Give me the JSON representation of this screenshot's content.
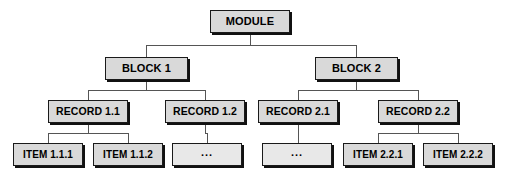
{
  "diagram": {
    "type": "hierarchy-tree",
    "levels": [
      "MODULE",
      "BLOCK",
      "RECORD",
      "ITEM"
    ],
    "style": {
      "node_fill": "#d9d9d9",
      "ellipsis_fill": "#e8e8e8",
      "node_border": "#1a1a1a",
      "node_shadow": "#111111",
      "connector_color": "#555555",
      "background": "#ffffff"
    },
    "nodes": [
      {
        "id": "module",
        "label": "MODULE",
        "level": "module",
        "x": 210,
        "y": 10,
        "w": 80,
        "h": 23
      },
      {
        "id": "block1",
        "label": "BLOCK 1",
        "level": "block",
        "x": 105,
        "y": 57,
        "w": 83,
        "h": 23
      },
      {
        "id": "block2",
        "label": "BLOCK 2",
        "level": "block",
        "x": 315,
        "y": 57,
        "w": 83,
        "h": 23
      },
      {
        "id": "record11",
        "label": "RECORD 1.1",
        "level": "record",
        "x": 48,
        "y": 100,
        "w": 80,
        "h": 23
      },
      {
        "id": "record12",
        "label": "RECORD 1.2",
        "level": "record",
        "x": 165,
        "y": 100,
        "w": 80,
        "h": 23
      },
      {
        "id": "record21",
        "label": "RECORD 2.1",
        "level": "record",
        "x": 258,
        "y": 100,
        "w": 80,
        "h": 23
      },
      {
        "id": "record22",
        "label": "RECORD 2.2",
        "level": "record",
        "x": 378,
        "y": 100,
        "w": 80,
        "h": 23
      },
      {
        "id": "item111",
        "label": "ITEM 1.1.1",
        "level": "item",
        "x": 13,
        "y": 143,
        "w": 70,
        "h": 23
      },
      {
        "id": "item112",
        "label": "ITEM 1.1.2",
        "level": "item",
        "x": 93,
        "y": 143,
        "w": 70,
        "h": 23
      },
      {
        "id": "ellipsis1",
        "label": "...",
        "level": "item",
        "x": 172,
        "y": 143,
        "w": 70,
        "h": 23,
        "ellipsis": true
      },
      {
        "id": "ellipsis2",
        "label": "...",
        "level": "item",
        "x": 262,
        "y": 143,
        "w": 70,
        "h": 23,
        "ellipsis": true
      },
      {
        "id": "item221",
        "label": "ITEM 2.2.1",
        "level": "item",
        "x": 343,
        "y": 143,
        "w": 70,
        "h": 23
      },
      {
        "id": "item222",
        "label": "ITEM 2.2.2",
        "level": "item",
        "x": 423,
        "y": 143,
        "w": 70,
        "h": 23
      }
    ],
    "edges": [
      {
        "from": "module",
        "to": "block1"
      },
      {
        "from": "module",
        "to": "block2"
      },
      {
        "from": "block1",
        "to": "record11"
      },
      {
        "from": "block1",
        "to": "record12"
      },
      {
        "from": "block2",
        "to": "record21"
      },
      {
        "from": "block2",
        "to": "record22"
      },
      {
        "from": "record11",
        "to": "item111"
      },
      {
        "from": "record11",
        "to": "item112"
      },
      {
        "from": "record12",
        "to": "ellipsis1"
      },
      {
        "from": "record21",
        "to": "ellipsis2"
      },
      {
        "from": "record22",
        "to": "item221"
      },
      {
        "from": "record22",
        "to": "item222"
      }
    ]
  }
}
